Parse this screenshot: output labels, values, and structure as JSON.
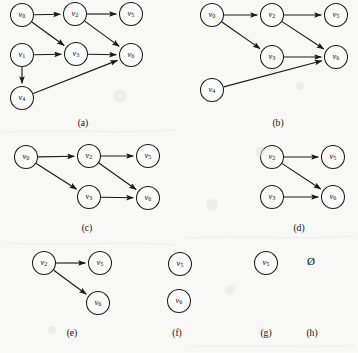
{
  "figure": {
    "background_color": "#f8f8f6",
    "ink_color": "#191919",
    "node_fill": "#fbfbfa",
    "node_radius": 11.5,
    "width": 358,
    "height": 353,
    "empty_set_symbol": "Ø"
  },
  "panels": [
    {
      "id": "a",
      "label": "(a)",
      "label_pos": {
        "x": 83,
        "y": 124
      },
      "nodes": [
        {
          "name": "v0",
          "base": "v",
          "sub": "0",
          "x": 22,
          "y": 15
        },
        {
          "name": "v1",
          "base": "v",
          "sub": "1",
          "x": 22,
          "y": 55
        },
        {
          "name": "v4",
          "base": "v",
          "sub": "4",
          "x": 22,
          "y": 98
        },
        {
          "name": "v2",
          "base": "v",
          "sub": "2",
          "x": 75,
          "y": 14
        },
        {
          "name": "v3",
          "base": "v",
          "sub": "3",
          "x": 76,
          "y": 54
        },
        {
          "name": "v5",
          "base": "v",
          "sub": "5",
          "x": 131,
          "y": 14
        },
        {
          "name": "v6",
          "base": "v",
          "sub": "6",
          "x": 131,
          "y": 55
        }
      ],
      "edges": [
        {
          "from": "v0",
          "to": "v2"
        },
        {
          "from": "v0",
          "to": "v3"
        },
        {
          "from": "v1",
          "to": "v3"
        },
        {
          "from": "v1",
          "to": "v4"
        },
        {
          "from": "v2",
          "to": "v5"
        },
        {
          "from": "v2",
          "to": "v6"
        },
        {
          "from": "v3",
          "to": "v6"
        },
        {
          "from": "v4",
          "to": "v6"
        }
      ]
    },
    {
      "id": "b",
      "label": "(b)",
      "label_pos": {
        "x": 278,
        "y": 124
      },
      "nodes": [
        {
          "name": "v0",
          "base": "v",
          "sub": "0",
          "x": 212,
          "y": 15
        },
        {
          "name": "v4",
          "base": "v",
          "sub": "4",
          "x": 212,
          "y": 90
        },
        {
          "name": "v2",
          "base": "v",
          "sub": "2",
          "x": 272,
          "y": 15
        },
        {
          "name": "v3",
          "base": "v",
          "sub": "3",
          "x": 272,
          "y": 57
        },
        {
          "name": "v5",
          "base": "v",
          "sub": "5",
          "x": 336,
          "y": 15
        },
        {
          "name": "v6",
          "base": "v",
          "sub": "6",
          "x": 336,
          "y": 57
        }
      ],
      "edges": [
        {
          "from": "v0",
          "to": "v2"
        },
        {
          "from": "v0",
          "to": "v3"
        },
        {
          "from": "v2",
          "to": "v5"
        },
        {
          "from": "v2",
          "to": "v6"
        },
        {
          "from": "v3",
          "to": "v6"
        },
        {
          "from": "v4",
          "to": "v6"
        }
      ]
    },
    {
      "id": "c",
      "label": "(c)",
      "label_pos": {
        "x": 87,
        "y": 229
      },
      "nodes": [
        {
          "name": "v0",
          "base": "v",
          "sub": "0",
          "x": 26,
          "y": 157
        },
        {
          "name": "v2",
          "base": "v",
          "sub": "2",
          "x": 89,
          "y": 156
        },
        {
          "name": "v3",
          "base": "v",
          "sub": "3",
          "x": 89,
          "y": 197
        },
        {
          "name": "v5",
          "base": "v",
          "sub": "5",
          "x": 148,
          "y": 156
        },
        {
          "name": "v6",
          "base": "v",
          "sub": "6",
          "x": 148,
          "y": 198
        }
      ],
      "edges": [
        {
          "from": "v0",
          "to": "v2"
        },
        {
          "from": "v0",
          "to": "v3"
        },
        {
          "from": "v2",
          "to": "v5"
        },
        {
          "from": "v2",
          "to": "v6"
        },
        {
          "from": "v3",
          "to": "v6"
        }
      ]
    },
    {
      "id": "d",
      "label": "(d)",
      "label_pos": {
        "x": 299,
        "y": 229
      },
      "nodes": [
        {
          "name": "v2",
          "base": "v",
          "sub": "2",
          "x": 272,
          "y": 157
        },
        {
          "name": "v3",
          "base": "v",
          "sub": "3",
          "x": 272,
          "y": 197
        },
        {
          "name": "v5",
          "base": "v",
          "sub": "5",
          "x": 333,
          "y": 157
        },
        {
          "name": "v6",
          "base": "v",
          "sub": "6",
          "x": 333,
          "y": 197
        }
      ],
      "edges": [
        {
          "from": "v2",
          "to": "v5"
        },
        {
          "from": "v2",
          "to": "v6"
        },
        {
          "from": "v3",
          "to": "v6"
        }
      ]
    },
    {
      "id": "e",
      "label": "(e)",
      "label_pos": {
        "x": 72,
        "y": 334
      },
      "nodes": [
        {
          "name": "v2",
          "base": "v",
          "sub": "2",
          "x": 44,
          "y": 263
        },
        {
          "name": "v5",
          "base": "v",
          "sub": "5",
          "x": 100,
          "y": 263
        },
        {
          "name": "v6",
          "base": "v",
          "sub": "6",
          "x": 98,
          "y": 303
        }
      ],
      "edges": [
        {
          "from": "v2",
          "to": "v5"
        },
        {
          "from": "v2",
          "to": "v6"
        }
      ]
    },
    {
      "id": "f",
      "label": "(f)",
      "label_pos": {
        "x": 177,
        "y": 334
      },
      "nodes": [
        {
          "name": "v5",
          "base": "v",
          "sub": "5",
          "x": 180,
          "y": 264
        },
        {
          "name": "v6",
          "base": "v",
          "sub": "6",
          "x": 179,
          "y": 301
        }
      ],
      "edges": []
    },
    {
      "id": "g",
      "label": "(g)",
      "label_pos": {
        "x": 266,
        "y": 334
      },
      "nodes": [
        {
          "name": "v5",
          "base": "v",
          "sub": "5",
          "x": 266,
          "y": 263
        }
      ],
      "edges": []
    },
    {
      "id": "h",
      "label": "(h)",
      "label_pos": {
        "x": 312,
        "y": 334
      },
      "nodes": [],
      "edges": [],
      "empty_set": {
        "symbol": "Ø",
        "x": 311,
        "y": 262
      }
    }
  ]
}
